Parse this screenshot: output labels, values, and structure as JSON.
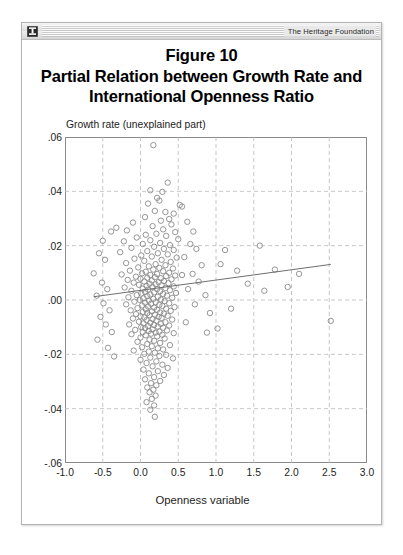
{
  "window": {
    "brand": "The Heritage Foundation",
    "logo_icon": "heritage-emblem-icon"
  },
  "figure": {
    "title_line1": "Figure 10",
    "title_line2": "Partial Relation between Growth Rate and",
    "title_line3": "International Openness Ratio"
  },
  "chart_data": {
    "type": "scatter",
    "xlabel": "Openness variable",
    "ylabel": "Growth rate (unexplained part)",
    "xlim": [
      -1.0,
      3.0
    ],
    "ylim": [
      -0.06,
      0.06
    ],
    "xticks": [
      "-1.0",
      "-0.5",
      "0.0",
      "0.5",
      "1.0",
      "1.5",
      "2.0",
      "2.5",
      "3.0"
    ],
    "xtick_values": [
      -1.0,
      -0.5,
      0.0,
      0.5,
      1.0,
      1.5,
      2.0,
      2.5,
      3.0
    ],
    "yticks": [
      ".06",
      ".04",
      ".02",
      ".00",
      "-.02",
      "-.04",
      "-.06"
    ],
    "ytick_values": [
      0.06,
      0.04,
      0.02,
      0.0,
      -0.02,
      -0.04,
      -0.06
    ],
    "grid": "dashed",
    "legend": "none",
    "marker": "open-circle",
    "marker_color": "#8a8a8a",
    "fit_line": {
      "name": "linear fit",
      "color": "#6e6e6e",
      "x": [
        -0.62,
        2.52
      ],
      "y": [
        0.0012,
        0.0131
      ]
    },
    "points": [
      [
        0.17,
        0.057
      ],
      [
        0.36,
        0.0432
      ],
      [
        0.13,
        0.0404
      ],
      [
        0.29,
        0.0398
      ],
      [
        0.22,
        0.0376
      ],
      [
        0.25,
        0.0366
      ],
      [
        0.1,
        0.0355
      ],
      [
        0.52,
        0.035
      ],
      [
        0.55,
        0.0344
      ],
      [
        0.19,
        0.0328
      ],
      [
        0.33,
        0.0324
      ],
      [
        0.44,
        0.0318
      ],
      [
        0.06,
        0.0305
      ],
      [
        0.38,
        0.0298
      ],
      [
        0.27,
        0.0292
      ],
      [
        -0.1,
        0.0285
      ],
      [
        0.41,
        0.0278
      ],
      [
        0.16,
        0.0272
      ],
      [
        -0.32,
        0.0266
      ],
      [
        0.3,
        0.026
      ],
      [
        -0.18,
        0.0256
      ],
      [
        0.46,
        0.025
      ],
      [
        0.21,
        0.0244
      ],
      [
        0.07,
        0.024
      ],
      [
        0.34,
        0.0236
      ],
      [
        -0.05,
        0.023
      ],
      [
        0.5,
        0.0224
      ],
      [
        0.13,
        0.022
      ],
      [
        -0.22,
        0.0216
      ],
      [
        0.26,
        0.021
      ],
      [
        0.03,
        0.0206
      ],
      [
        0.39,
        0.0202
      ],
      [
        1.58,
        0.02
      ],
      [
        0.18,
        0.0196
      ],
      [
        -0.12,
        0.0192
      ],
      [
        0.31,
        0.0188
      ],
      [
        0.44,
        0.0184
      ],
      [
        0.09,
        0.018
      ],
      [
        -0.27,
        0.0176
      ],
      [
        0.23,
        0.0172
      ],
      [
        0.36,
        0.0168
      ],
      [
        0.01,
        0.0164
      ],
      [
        0.15,
        0.016
      ],
      [
        0.48,
        0.0156
      ],
      [
        -0.08,
        0.0152
      ],
      [
        0.28,
        0.0148
      ],
      [
        0.05,
        0.0144
      ],
      [
        0.4,
        0.014
      ],
      [
        -0.19,
        0.0136
      ],
      [
        0.2,
        0.0132
      ],
      [
        0.33,
        0.0128
      ],
      [
        0.11,
        0.0124
      ],
      [
        -0.03,
        0.012
      ],
      [
        0.25,
        0.0118
      ],
      [
        0.43,
        0.0116
      ],
      [
        0.17,
        0.0112
      ],
      [
        -0.14,
        0.0108
      ],
      [
        0.3,
        0.0106
      ],
      [
        0.07,
        0.0104
      ],
      [
        0.38,
        0.01
      ],
      [
        0.02,
        0.0098
      ],
      [
        0.22,
        0.0096
      ],
      [
        -0.25,
        0.0094
      ],
      [
        0.13,
        0.0092
      ],
      [
        0.46,
        0.009
      ],
      [
        0.34,
        0.0088
      ],
      [
        -0.06,
        0.0086
      ],
      [
        0.19,
        0.0084
      ],
      [
        0.09,
        0.0082
      ],
      [
        0.27,
        0.008
      ],
      [
        0.0,
        0.0078
      ],
      [
        0.41,
        0.0076
      ],
      [
        -0.17,
        0.0074
      ],
      [
        0.15,
        0.0072
      ],
      [
        0.31,
        0.007
      ],
      [
        0.05,
        0.0068
      ],
      [
        0.24,
        0.0066
      ],
      [
        -0.09,
        0.0064
      ],
      [
        0.37,
        0.0062
      ],
      [
        0.12,
        0.006
      ],
      [
        0.2,
        0.0058
      ],
      [
        -0.02,
        0.0056
      ],
      [
        0.28,
        0.0054
      ],
      [
        0.08,
        0.0052
      ],
      [
        0.44,
        0.005
      ],
      [
        0.16,
        0.0048
      ],
      [
        -0.21,
        0.0046
      ],
      [
        0.33,
        0.0044
      ],
      [
        0.03,
        0.0042
      ],
      [
        0.22,
        0.004
      ],
      [
        0.1,
        0.0038
      ],
      [
        0.39,
        0.0036
      ],
      [
        -0.12,
        0.0034
      ],
      [
        0.26,
        0.0032
      ],
      [
        0.06,
        0.003
      ],
      [
        0.18,
        0.0028
      ],
      [
        0.47,
        0.0026
      ],
      [
        0.01,
        0.0024
      ],
      [
        0.3,
        0.0022
      ],
      [
        0.13,
        0.002
      ],
      [
        -0.05,
        0.0018
      ],
      [
        0.35,
        0.0016
      ],
      [
        0.09,
        0.0014
      ],
      [
        0.23,
        0.0012
      ],
      [
        -0.16,
        0.001
      ],
      [
        0.42,
        0.0008
      ],
      [
        0.04,
        0.0006
      ],
      [
        0.17,
        0.0004
      ],
      [
        0.27,
        0.0002
      ],
      [
        -0.01,
        0.0
      ],
      [
        0.11,
        -0.0002
      ],
      [
        0.32,
        -0.0004
      ],
      [
        -0.08,
        -0.0006
      ],
      [
        0.2,
        -0.0008
      ],
      [
        0.06,
        -0.001
      ],
      [
        0.38,
        -0.0012
      ],
      [
        0.14,
        -0.0014
      ],
      [
        -0.19,
        -0.0016
      ],
      [
        0.25,
        -0.0018
      ],
      [
        0.02,
        -0.002
      ],
      [
        0.29,
        -0.0022
      ],
      [
        0.1,
        -0.0024
      ],
      [
        0.45,
        -0.0026
      ],
      [
        0.18,
        -0.0028
      ],
      [
        -0.04,
        -0.003
      ],
      [
        0.34,
        -0.0032
      ],
      [
        0.07,
        -0.0034
      ],
      [
        0.22,
        -0.0036
      ],
      [
        -0.13,
        -0.0038
      ],
      [
        0.4,
        -0.004
      ],
      [
        0.15,
        -0.0042
      ],
      [
        0.03,
        -0.0044
      ],
      [
        0.26,
        -0.0046
      ],
      [
        0.09,
        -0.0048
      ],
      [
        0.31,
        -0.005
      ],
      [
        -0.06,
        -0.0052
      ],
      [
        0.19,
        -0.0054
      ],
      [
        0.12,
        -0.0056
      ],
      [
        0.36,
        -0.0058
      ],
      [
        0.0,
        -0.006
      ],
      [
        0.24,
        -0.0062
      ],
      [
        0.05,
        -0.0064
      ],
      [
        0.28,
        -0.0066
      ],
      [
        -0.1,
        -0.0068
      ],
      [
        0.16,
        -0.007
      ],
      [
        0.42,
        -0.0072
      ],
      [
        0.08,
        -0.0074
      ],
      [
        0.21,
        -0.0076
      ],
      [
        2.52,
        -0.0077
      ],
      [
        -0.02,
        -0.008
      ],
      [
        0.33,
        -0.0082
      ],
      [
        0.13,
        -0.0084
      ],
      [
        0.04,
        -0.0086
      ],
      [
        0.27,
        -0.0088
      ],
      [
        -0.15,
        -0.009
      ],
      [
        0.18,
        -0.0092
      ],
      [
        0.38,
        -0.0094
      ],
      [
        0.1,
        -0.0096
      ],
      [
        0.23,
        -0.0098
      ],
      [
        0.01,
        -0.01
      ],
      [
        0.3,
        -0.0102
      ],
      [
        0.06,
        -0.0104
      ],
      [
        1.02,
        -0.0105
      ],
      [
        0.16,
        -0.0108
      ],
      [
        -0.07,
        -0.011
      ],
      [
        0.35,
        -0.0112
      ],
      [
        0.11,
        -0.0114
      ],
      [
        0.25,
        -0.0116
      ],
      [
        0.03,
        -0.0118
      ],
      [
        0.2,
        -0.012
      ],
      [
        0.44,
        -0.0122
      ],
      [
        0.14,
        -0.0124
      ],
      [
        -0.12,
        -0.0126
      ],
      [
        0.29,
        -0.0128
      ],
      [
        0.07,
        -0.013
      ],
      [
        0.22,
        -0.0134
      ],
      [
        0.0,
        -0.0138
      ],
      [
        0.32,
        -0.0142
      ],
      [
        0.12,
        -0.0146
      ],
      [
        0.18,
        -0.015
      ],
      [
        -0.04,
        -0.0154
      ],
      [
        0.26,
        -0.0158
      ],
      [
        0.09,
        -0.0162
      ],
      [
        0.39,
        -0.0166
      ],
      [
        0.15,
        -0.017
      ],
      [
        0.02,
        -0.0174
      ],
      [
        0.23,
        -0.0178
      ],
      [
        0.3,
        -0.0182
      ],
      [
        -0.09,
        -0.0186
      ],
      [
        0.11,
        -0.019
      ],
      [
        0.19,
        -0.0194
      ],
      [
        0.05,
        -0.0198
      ],
      [
        0.34,
        -0.0202
      ],
      [
        0.25,
        -0.0206
      ],
      [
        0.13,
        -0.0212
      ],
      [
        0.43,
        -0.0215
      ],
      [
        0.0,
        -0.022
      ],
      [
        0.21,
        -0.0226
      ],
      [
        0.08,
        -0.0232
      ],
      [
        0.29,
        -0.0238
      ],
      [
        0.16,
        -0.0244
      ],
      [
        0.36,
        -0.025
      ],
      [
        0.04,
        -0.0256
      ],
      [
        0.23,
        -0.0262
      ],
      [
        0.11,
        -0.027
      ],
      [
        0.31,
        -0.0276
      ],
      [
        0.18,
        -0.0284
      ],
      [
        0.06,
        -0.0292
      ],
      [
        0.26,
        -0.0298
      ],
      [
        0.14,
        -0.0306
      ],
      [
        0.21,
        -0.0314
      ],
      [
        0.09,
        -0.0322
      ],
      [
        0.17,
        -0.033
      ],
      [
        0.12,
        -0.034
      ],
      [
        0.2,
        -0.0352
      ],
      [
        0.15,
        -0.0364
      ],
      [
        0.08,
        -0.0376
      ],
      [
        0.18,
        -0.0388
      ],
      [
        0.13,
        -0.0404
      ],
      [
        0.19,
        -0.043
      ],
      [
        -0.55,
        0.0172
      ],
      [
        -0.47,
        0.0148
      ],
      [
        -0.62,
        0.0098
      ],
      [
        -0.51,
        0.0064
      ],
      [
        -0.44,
        0.004
      ],
      [
        -0.58,
        0.0016
      ],
      [
        -0.49,
        -0.0012
      ],
      [
        -0.41,
        -0.0038
      ],
      [
        -0.53,
        -0.0062
      ],
      [
        -0.46,
        -0.009
      ],
      [
        -0.38,
        -0.0118
      ],
      [
        -0.57,
        -0.0146
      ],
      [
        -0.43,
        -0.0176
      ],
      [
        -0.35,
        -0.0208
      ],
      [
        -0.5,
        0.0218
      ],
      [
        -0.39,
        0.0252
      ],
      [
        0.62,
        0.0288
      ],
      [
        0.7,
        0.0252
      ],
      [
        0.66,
        0.0206
      ],
      [
        0.74,
        0.0188
      ],
      [
        0.58,
        0.0158
      ],
      [
        0.81,
        0.0128
      ],
      [
        0.69,
        0.0096
      ],
      [
        0.77,
        0.0068
      ],
      [
        0.63,
        0.004
      ],
      [
        0.86,
        0.0018
      ],
      [
        0.72,
        -0.0016
      ],
      [
        0.92,
        -0.0048
      ],
      [
        1.12,
        0.0184
      ],
      [
        1.28,
        0.0108
      ],
      [
        1.42,
        0.006
      ],
      [
        1.64,
        0.0034
      ],
      [
        1.78,
        0.0112
      ],
      [
        1.95,
        0.0048
      ],
      [
        2.1,
        0.0096
      ],
      [
        0.55,
        0.0092
      ],
      [
        0.6,
        -0.0082
      ],
      [
        0.88,
        -0.012
      ],
      [
        1.06,
        0.0132
      ],
      [
        1.2,
        -0.0032
      ]
    ]
  }
}
